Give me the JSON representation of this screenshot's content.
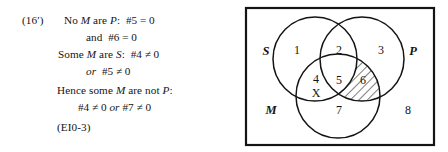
{
  "figure": {
    "step_label": "(16′)",
    "reference": "(EI0-3)"
  },
  "derivation": {
    "lines": [
      {
        "id": "premise-1a",
        "text": "No M are P:  #5 = 0"
      },
      {
        "id": "premise-1b",
        "text": "and  #6 = 0"
      },
      {
        "id": "premise-2a",
        "text": "Some M are S:  #4 ≠ 0"
      },
      {
        "id": "premise-2b",
        "text": "or  #5 ≠ 0"
      },
      {
        "id": "conclusion-a",
        "text": "Hence some M are not P:"
      },
      {
        "id": "conclusion-b",
        "text": "#4 ≠ 0 or #7 ≠ 0"
      }
    ],
    "line_1": {
      "prefix": "No ",
      "term_1": "M",
      "middle": " are ",
      "term_2": "P",
      "suffix": ":",
      "expr": "#5 = 0"
    },
    "line_2": {
      "conj": "and",
      "expr": "#6 = 0"
    },
    "line_3": {
      "prefix": "Some ",
      "term_1": "M",
      "middle": " are ",
      "term_2": "S",
      "suffix": ":",
      "expr": "#4 ≠ 0"
    },
    "line_4": {
      "conj": "or",
      "expr": "#5 ≠ 0"
    },
    "line_5": {
      "prefix": "Hence some ",
      "term_1": "M",
      "middle": " are not ",
      "term_2": "P",
      "suffix": ":"
    },
    "line_6": {
      "expr_1": "#4 ≠ 0",
      "conj": "or",
      "expr_2": "#7 ≠ 0"
    }
  },
  "venn": {
    "set_labels": [
      {
        "name": "S",
        "text": "S"
      },
      {
        "name": "P",
        "text": "P"
      },
      {
        "name": "M",
        "text": "M"
      }
    ],
    "regions": [
      {
        "id": 1,
        "label": "1",
        "shaded": false,
        "marked": false
      },
      {
        "id": 2,
        "label": "2",
        "shaded": false,
        "marked": false
      },
      {
        "id": 3,
        "label": "3",
        "shaded": false,
        "marked": false
      },
      {
        "id": 4,
        "label": "4",
        "shaded": false,
        "marked": true
      },
      {
        "id": 5,
        "label": "5",
        "shaded": true,
        "marked": false
      },
      {
        "id": 6,
        "label": "6",
        "shaded": true,
        "marked": false
      },
      {
        "id": 7,
        "label": "7",
        "shaded": false,
        "marked": false
      },
      {
        "id": 8,
        "label": "8",
        "shaded": false,
        "marked": false
      }
    ],
    "x_marker": "X",
    "shading_style": "diagonal-hatch",
    "colors": {
      "stroke": "#141414",
      "background": "#ffffff",
      "hatch": "#141414"
    }
  }
}
